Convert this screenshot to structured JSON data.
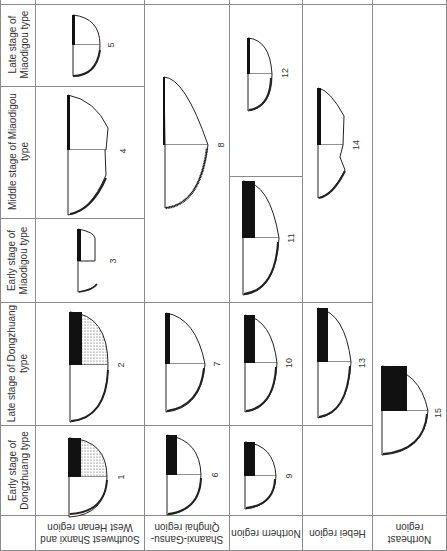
{
  "figure": {
    "periods": [
      {
        "id": "early_dongzhuang",
        "label": "Early stage of Dongzhuang type"
      },
      {
        "id": "late_dongzhuang",
        "label": "Late stage of Dongzhuang type"
      },
      {
        "id": "early_miaodigou",
        "label": "Early stage of Miaodigou type"
      },
      {
        "id": "middle_miaodigou",
        "label": "Middle stage of Miaodigou type"
      },
      {
        "id": "late_miaodigou",
        "label": "Late stage of Miaodigou type"
      }
    ],
    "regions": [
      {
        "id": "sw_shanxi_w_henan",
        "label": "Southwest Shanxi and West Henan region"
      },
      {
        "id": "shaanxi_gansu_qinghai",
        "label": "Shaanxi-Gansu-Qinghai region"
      },
      {
        "id": "northern",
        "label": "Northern region"
      },
      {
        "id": "hebei",
        "label": "Hebei region"
      },
      {
        "id": "northeast",
        "label": "Northeast region"
      }
    ],
    "vessels": [
      {
        "number": "1",
        "region": "Southwest Shanxi and West Henan region",
        "period": "Early stage of Dongzhuang type"
      },
      {
        "number": "2",
        "region": "Southwest Shanxi and West Henan region",
        "period": "Late stage of Dongzhuang type"
      },
      {
        "number": "3",
        "region": "Southwest Shanxi and West Henan region",
        "period": "Early stage of Miaodigou type"
      },
      {
        "number": "4",
        "region": "Southwest Shanxi and West Henan region",
        "period": "Middle stage of Miaodigou type"
      },
      {
        "number": "5",
        "region": "Southwest Shanxi and West Henan region",
        "period": "Late stage of Miaodigou type"
      },
      {
        "number": "6",
        "region": "Shaanxi-Gansu-Qinghai region",
        "period": "Early stage of Dongzhuang type"
      },
      {
        "number": "7",
        "region": "Shaanxi-Gansu-Qinghai region",
        "period": "Late stage of Dongzhuang type"
      },
      {
        "number": "8",
        "region": "Shaanxi-Gansu-Qinghai region",
        "period": "Miaodigou type (early–late)"
      },
      {
        "number": "9",
        "region": "Northern region",
        "period": "Early stage of Dongzhuang type"
      },
      {
        "number": "10",
        "region": "Northern region",
        "period": "Late stage of Dongzhuang type"
      },
      {
        "number": "11",
        "region": "Northern region",
        "period": "Early/Middle stage of Miaodigou type"
      },
      {
        "number": "12",
        "region": "Northern region",
        "period": "Middle/Late stage of Miaodigou type"
      },
      {
        "number": "13",
        "region": "Hebei region",
        "period": "Late stage of Dongzhuang type"
      },
      {
        "number": "14",
        "region": "Hebei region",
        "period": "Middle/Late stage of Miaodigou type"
      },
      {
        "number": "15",
        "region": "Northeast region",
        "period": "Early/Late stage of Dongzhuang type"
      }
    ]
  }
}
